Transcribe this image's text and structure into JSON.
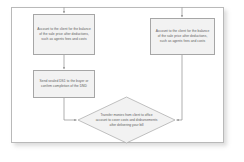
{
  "diagram": {
    "type": "flowchart",
    "colors": {
      "node_fill": "#f2f2f2",
      "node_border": "#a6a6a6",
      "connector": "#8c8c8c",
      "frame_border": "#b9b9b9",
      "text": "#5c5c5c",
      "background": "#ffffff"
    },
    "nodes": [
      {
        "id": "account-left",
        "shape": "process",
        "text": "Account to the client for the balance of the sale price after deductions, such as agents fees and costs"
      },
      {
        "id": "send-ds1",
        "shape": "process",
        "text": "Send sealed DS1 to the buyer or confirm completion of the DND"
      },
      {
        "id": "account-right",
        "shape": "process",
        "text": "Account to the client for the balance of the sale price after deductions, such as agents fees and costs"
      },
      {
        "id": "transfer-monies",
        "shape": "decision",
        "text": "Transfer monies from client to office account to cover costs and disbursements after delivering your bill"
      }
    ],
    "connectors": [
      {
        "id": "entry-to-account-left",
        "from": "top-edge",
        "to": "account-left",
        "arrow": true
      },
      {
        "id": "entry-to-account-right",
        "from": "top-edge",
        "to": "account-right",
        "arrow": true
      },
      {
        "id": "account-left-to-send-ds1",
        "from": "account-left",
        "to": "send-ds1",
        "arrow": true
      },
      {
        "id": "send-ds1-to-transfer",
        "from": "send-ds1",
        "to": "transfer-monies",
        "arrow": true
      },
      {
        "id": "account-right-to-transfer",
        "from": "account-right",
        "to": "transfer-monies",
        "arrow": true
      }
    ]
  }
}
